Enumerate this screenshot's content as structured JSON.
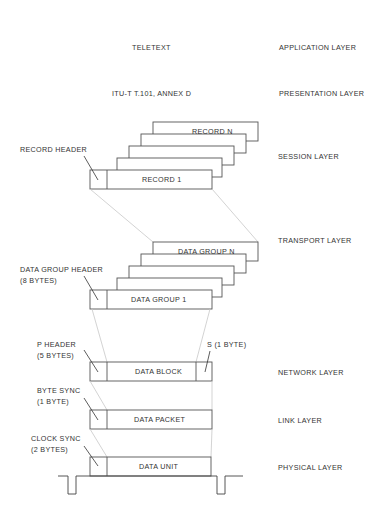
{
  "layers": {
    "application": "APPLICATION LAYER",
    "presentation": "PRESENTATION LAYER",
    "session": "SESSION LAYER",
    "transport": "TRANSPORT LAYER",
    "network": "NETWORK LAYER",
    "link": "LINK LAYER",
    "physical": "PHYSICAL LAYER"
  },
  "application": {
    "label": "TELETEXT"
  },
  "presentation": {
    "label": "ITU-T T.101,  ANNEX  D"
  },
  "session": {
    "header_label": "RECORD  HEADER",
    "first": "RECORD  1",
    "last": "RECORD  N"
  },
  "transport": {
    "header_label_line1": "DATA  GROUP  HEADER",
    "header_label_line2": "(8  BYTES)",
    "first": "DATA  GROUP  1",
    "last": "DATA  GROUP  N"
  },
  "network": {
    "header_label_line1": "P  HEADER",
    "header_label_line2": "(5  BYTES)",
    "trailer_label": "S  (1 BYTE)",
    "block": "DATA  BLOCK"
  },
  "link": {
    "sync_label_line1": "BYTE  SYNC",
    "sync_label_line2": "(1  BYTE)",
    "packet": "DATA  PACKET"
  },
  "physical": {
    "sync_label_line1": "CLOCK  SYNC",
    "sync_label_line2": "(2  BYTES)",
    "unit": "DATA  UNIT"
  }
}
